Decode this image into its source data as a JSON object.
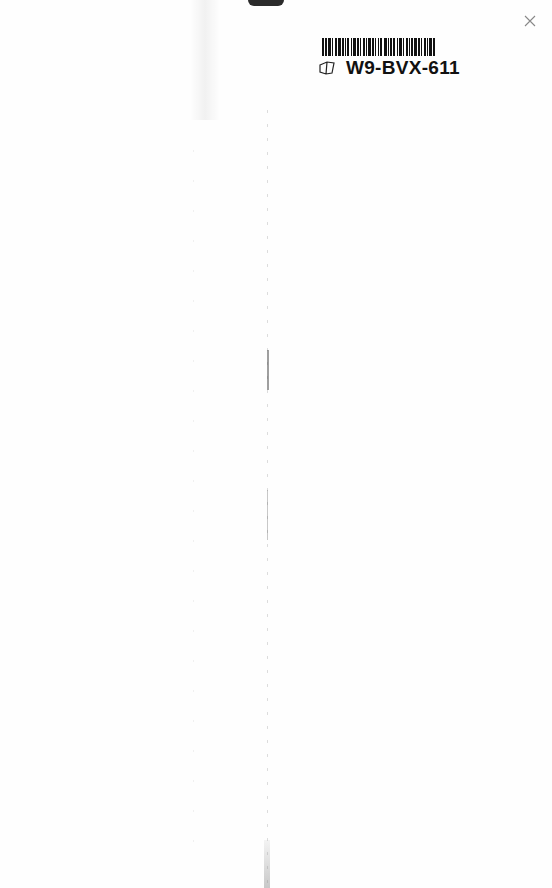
{
  "page": {
    "type": "scanned-blank-book-page",
    "background": "#fefefe"
  },
  "sticker": {
    "code": "W9-BVX-611",
    "barcode_icon": "barcode-icon",
    "book_icon": "book-icon",
    "barcode_bars": [
      2,
      1,
      2,
      1,
      3,
      1,
      1,
      2,
      2,
      1,
      3,
      1,
      2,
      1,
      1,
      1,
      2,
      2,
      1,
      1,
      3,
      1,
      2,
      1,
      1,
      2,
      2,
      1,
      1,
      1,
      3,
      1,
      2,
      1,
      1,
      2,
      1,
      1,
      2,
      2,
      3,
      1,
      1,
      1,
      2,
      1,
      2,
      2,
      1,
      1,
      3,
      1,
      1,
      2,
      2,
      1,
      1,
      1,
      2,
      1,
      3,
      1,
      2,
      1,
      1,
      2,
      2,
      1,
      1,
      1,
      3,
      1,
      2,
      2
    ]
  },
  "marks": {
    "close_icon": "x-mark-icon",
    "close_color": "#888888"
  }
}
